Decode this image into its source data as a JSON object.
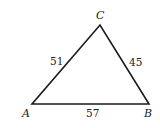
{
  "diagram": {
    "type": "triangle",
    "vertices": {
      "A": {
        "label": "A",
        "x": 32,
        "y": 104
      },
      "B": {
        "label": "B",
        "x": 149,
        "y": 104
      },
      "C": {
        "label": "C",
        "x": 100,
        "y": 25
      }
    },
    "sides": {
      "AC": {
        "label": "51"
      },
      "CB": {
        "label": "45"
      },
      "AB": {
        "label": "57"
      }
    },
    "stroke_color": "#1a1a1a",
    "text_color": "#222222"
  }
}
